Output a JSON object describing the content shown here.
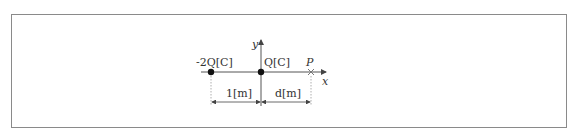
{
  "diagram": {
    "axes": {
      "x_label": "x",
      "y_label": "y"
    },
    "charges": [
      {
        "label": "-2Q[C]",
        "position_m": -1
      },
      {
        "label": "Q[C]",
        "position_m": 0
      }
    ],
    "point": {
      "label": "P",
      "position": "d"
    },
    "dimensions": [
      {
        "label": "1[m]",
        "from": "-2Q",
        "to": "Q"
      },
      {
        "label": "d[m]",
        "from": "Q",
        "to": "P"
      }
    ]
  }
}
